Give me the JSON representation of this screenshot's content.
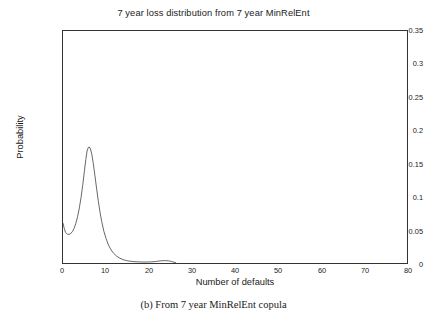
{
  "chart_data": {
    "type": "line",
    "title": "7 year loss distribution from 7 year MinRelEnt",
    "xlabel": "Number of defaults",
    "ylabel": "Probability",
    "xlim": [
      0,
      80
    ],
    "ylim": [
      0,
      0.35
    ],
    "grid": false,
    "legend": null,
    "xticks": [
      "0",
      "10",
      "20",
      "30",
      "40",
      "50",
      "60",
      "70",
      "80"
    ],
    "xtick_values": [
      0,
      10,
      20,
      30,
      40,
      50,
      60,
      70,
      80
    ],
    "yticks": [
      "0",
      "0.05",
      "0.1",
      "0.15",
      "0.2",
      "0.25",
      "0.3",
      "0.35"
    ],
    "ytick_values": [
      0,
      0.05,
      0.1,
      0.15,
      0.2,
      0.25,
      0.3,
      0.35
    ],
    "line_color": "#555555",
    "series": [
      {
        "name": "7 year MinRelEnt loss distribution",
        "x": [
          0,
          0.3,
          0.6,
          1.0,
          1.4,
          1.8,
          2.2,
          2.6,
          3.0,
          3.4,
          3.8,
          4.2,
          4.6,
          5.0,
          5.3,
          5.6,
          5.9,
          6.1,
          6.4,
          6.7,
          7.0,
          7.4,
          7.8,
          8.2,
          8.6,
          9.0,
          9.5,
          10.0,
          10.6,
          11.2,
          11.8,
          12.5,
          13.2,
          14.0,
          14.8,
          15.6,
          16.5,
          17.5,
          18.5,
          19.5,
          20.5,
          21.5,
          22.3,
          23.0,
          23.8,
          24.5,
          25.2,
          25.8,
          26.2
        ],
        "y": [
          0.06,
          0.052,
          0.046,
          0.0435,
          0.0432,
          0.0445,
          0.0475,
          0.0525,
          0.06,
          0.07,
          0.083,
          0.099,
          0.118,
          0.14,
          0.156,
          0.169,
          0.1745,
          0.175,
          0.172,
          0.164,
          0.152,
          0.133,
          0.113,
          0.094,
          0.077,
          0.0625,
          0.048,
          0.037,
          0.0268,
          0.0196,
          0.0145,
          0.0102,
          0.0073,
          0.005,
          0.0036,
          0.0027,
          0.0021,
          0.0017,
          0.0015,
          0.0015,
          0.0017,
          0.0022,
          0.0029,
          0.0034,
          0.0036,
          0.0033,
          0.0024,
          0.0012,
          0.0004
        ]
      }
    ]
  },
  "caption": "(b) From 7 year MinRelEnt copula"
}
